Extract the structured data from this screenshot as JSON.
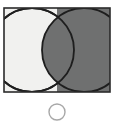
{
  "canvas": {
    "width": 116,
    "height": 126,
    "background_color": "#ffffff"
  },
  "figure": {
    "name": "two-overlapping-circles-on-split-background",
    "panel": {
      "x": 4,
      "y": 8,
      "width": 106,
      "height": 84,
      "border_color": "#2b2b2b",
      "border_width": 1.6,
      "left_fill_color": "#f1f1ef",
      "right_fill_color": "#6f7070",
      "split_x": 57
    },
    "shapes": [
      {
        "id": "left-circle",
        "type": "circle",
        "cx": 32,
        "cy": 50,
        "r": 42,
        "fill_color": "#f1f1ef",
        "stroke_color": "#1e1e1e",
        "stroke_width": 1.8
      },
      {
        "id": "right-circle",
        "type": "circle",
        "cx": 84,
        "cy": 50,
        "r": 42,
        "fill_color": "#6f7070",
        "stroke_color": "#1e1e1e",
        "stroke_width": 1.8
      },
      {
        "id": "answer-circle",
        "type": "circle",
        "cx": 57,
        "cy": 112,
        "r": 8,
        "fill_color": "#ffffff",
        "stroke_color": "#a8a8a8",
        "stroke_width": 1.4
      }
    ]
  },
  "labels": {
    "panel_title": "",
    "answer_title": ""
  }
}
